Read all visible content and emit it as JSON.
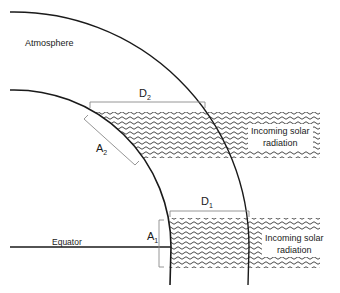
{
  "diagram": {
    "labels": {
      "atmosphere": "Atmosphere",
      "equator": "Equator",
      "d2": "D",
      "d2_sub": "2",
      "a2": "A",
      "a2_sub": "2",
      "d1": "D",
      "d1_sub": "1",
      "a1": "A",
      "a1_sub": "1"
    },
    "beams": [
      {
        "id": "upper",
        "label_line1": "Incoming solar",
        "label_line2": "radiation"
      },
      {
        "id": "lower",
        "label_line1": "Incoming solar",
        "label_line2": "radiation"
      }
    ],
    "colors": {
      "line": "#1a1a1a",
      "bracket": "#8a8a8a",
      "wave": "#333333",
      "background": "#ffffff"
    }
  }
}
